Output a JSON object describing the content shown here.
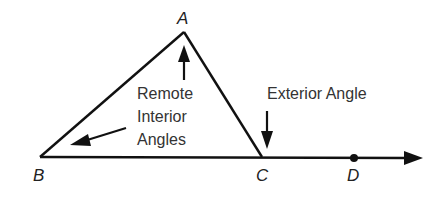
{
  "diagram": {
    "points": {
      "A": {
        "label": "A"
      },
      "B": {
        "label": "B"
      },
      "C": {
        "label": "C"
      },
      "D": {
        "label": "D"
      }
    },
    "annotations": {
      "remote_line1": "Remote",
      "remote_line2": "Interior",
      "remote_line3": "Angles",
      "exterior": "Exterior Angle"
    },
    "colors": {
      "stroke": "#111111",
      "text": "#333333"
    }
  }
}
